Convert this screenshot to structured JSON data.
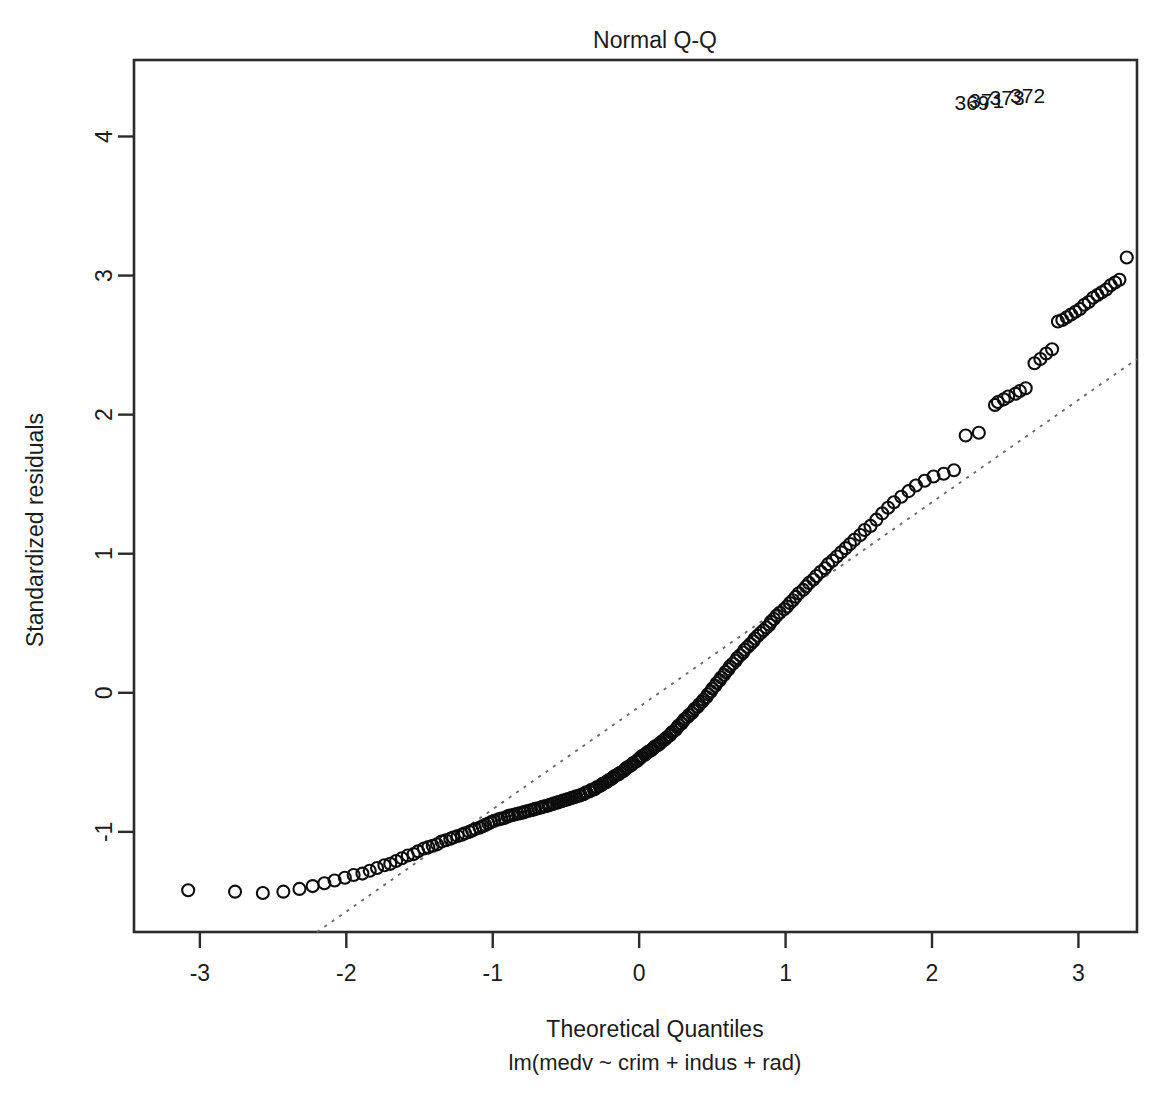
{
  "chart_data": {
    "type": "scatter",
    "title": "Normal Q-Q",
    "xlabel": "Theoretical Quantiles",
    "sublabel": "lm(medv ~ crim + indus + rad)",
    "ylabel": "Standardized residuals",
    "xlim": [
      -3.45,
      3.4
    ],
    "ylim": [
      -1.72,
      4.55
    ],
    "xticks": [
      -3,
      -2,
      -1,
      0,
      1,
      2,
      3
    ],
    "xtick_labels": [
      "-3",
      "-2",
      "-1",
      "0",
      "1",
      "2",
      "3"
    ],
    "yticks": [
      -1,
      0,
      1,
      2,
      3,
      4
    ],
    "ytick_labels": [
      "-1",
      "0",
      "1",
      "2",
      "3",
      "4"
    ],
    "grid": false,
    "legend": "none",
    "reference_line": {
      "style": "dotted",
      "x0": -2.2,
      "y0": -1.72,
      "x1": 3.4,
      "y1": 2.4,
      "color": "#6b6b6b"
    },
    "point_style": {
      "marker": "open-circle",
      "radius": 6.0,
      "color": "#0d0d0d"
    },
    "outlier_labels": [
      {
        "label": "369",
        "x": 2.42,
        "y": 4.13
      },
      {
        "label": "371",
        "x": 2.52,
        "y": 4.15
      },
      {
        "label": "373",
        "x": 2.66,
        "y": 4.17
      },
      {
        "label": "372",
        "x": 2.8,
        "y": 4.18
      }
    ],
    "points": [
      [
        -3.08,
        -1.42
      ],
      [
        -2.76,
        -1.43
      ],
      [
        -2.57,
        -1.44
      ],
      [
        -2.43,
        -1.43
      ],
      [
        -2.32,
        -1.41
      ],
      [
        -2.23,
        -1.39
      ],
      [
        -2.15,
        -1.37
      ],
      [
        -2.08,
        -1.35
      ],
      [
        -2.01,
        -1.33
      ],
      [
        -1.95,
        -1.31
      ],
      [
        -1.89,
        -1.3
      ],
      [
        -1.84,
        -1.28
      ],
      [
        -1.79,
        -1.26
      ],
      [
        -1.74,
        -1.24
      ],
      [
        -1.7,
        -1.23
      ],
      [
        -1.66,
        -1.21
      ],
      [
        -1.62,
        -1.19
      ],
      [
        -1.58,
        -1.17
      ],
      [
        -1.54,
        -1.16
      ],
      [
        -1.51,
        -1.14
      ],
      [
        -1.47,
        -1.12
      ],
      [
        -1.44,
        -1.11
      ],
      [
        -1.41,
        -1.1
      ],
      [
        -1.38,
        -1.09
      ],
      [
        -1.35,
        -1.07
      ],
      [
        -1.32,
        -1.06
      ],
      [
        -1.29,
        -1.05
      ],
      [
        -1.27,
        -1.04
      ],
      [
        -1.24,
        -1.03
      ],
      [
        -1.21,
        -1.02
      ],
      [
        -1.19,
        -1.01
      ],
      [
        -1.16,
        -1.0
      ],
      [
        -1.14,
        -0.99
      ],
      [
        -1.12,
        -0.98
      ],
      [
        -1.09,
        -0.97
      ],
      [
        -1.07,
        -0.96
      ],
      [
        -1.05,
        -0.95
      ],
      [
        -1.03,
        -0.94
      ],
      [
        -1.01,
        -0.93
      ],
      [
        -0.99,
        -0.92
      ],
      [
        -0.96,
        -0.91
      ],
      [
        -0.94,
        -0.905
      ],
      [
        -0.92,
        -0.9
      ],
      [
        -0.9,
        -0.89
      ],
      [
        -0.89,
        -0.885
      ],
      [
        -0.87,
        -0.88
      ],
      [
        -0.85,
        -0.875
      ],
      [
        -0.83,
        -0.87
      ],
      [
        -0.81,
        -0.865
      ],
      [
        -0.79,
        -0.86
      ],
      [
        -0.78,
        -0.855
      ],
      [
        -0.76,
        -0.85
      ],
      [
        -0.74,
        -0.845
      ],
      [
        -0.72,
        -0.84
      ],
      [
        -0.71,
        -0.835
      ],
      [
        -0.69,
        -0.83
      ],
      [
        -0.67,
        -0.825
      ],
      [
        -0.66,
        -0.82
      ],
      [
        -0.64,
        -0.815
      ],
      [
        -0.62,
        -0.81
      ],
      [
        -0.61,
        -0.805
      ],
      [
        -0.59,
        -0.8
      ],
      [
        -0.58,
        -0.795
      ],
      [
        -0.56,
        -0.79
      ],
      [
        -0.55,
        -0.785
      ],
      [
        -0.53,
        -0.78
      ],
      [
        -0.52,
        -0.775
      ],
      [
        -0.5,
        -0.77
      ],
      [
        -0.49,
        -0.765
      ],
      [
        -0.47,
        -0.76
      ],
      [
        -0.46,
        -0.755
      ],
      [
        -0.44,
        -0.75
      ],
      [
        -0.43,
        -0.745
      ],
      [
        -0.41,
        -0.74
      ],
      [
        -0.4,
        -0.735
      ],
      [
        -0.38,
        -0.73
      ],
      [
        -0.37,
        -0.72
      ],
      [
        -0.36,
        -0.715
      ],
      [
        -0.34,
        -0.71
      ],
      [
        -0.33,
        -0.7
      ],
      [
        -0.31,
        -0.695
      ],
      [
        -0.3,
        -0.69
      ],
      [
        -0.29,
        -0.68
      ],
      [
        -0.27,
        -0.67
      ],
      [
        -0.26,
        -0.665
      ],
      [
        -0.25,
        -0.655
      ],
      [
        -0.23,
        -0.645
      ],
      [
        -0.22,
        -0.64
      ],
      [
        -0.21,
        -0.63
      ],
      [
        -0.19,
        -0.62
      ],
      [
        -0.18,
        -0.61
      ],
      [
        -0.17,
        -0.6
      ],
      [
        -0.15,
        -0.59
      ],
      [
        -0.14,
        -0.585
      ],
      [
        -0.13,
        -0.575
      ],
      [
        -0.11,
        -0.565
      ],
      [
        -0.1,
        -0.555
      ],
      [
        -0.09,
        -0.545
      ],
      [
        -0.08,
        -0.535
      ],
      [
        -0.06,
        -0.525
      ],
      [
        -0.05,
        -0.515
      ],
      [
        -0.04,
        -0.505
      ],
      [
        -0.02,
        -0.495
      ],
      [
        -0.01,
        -0.485
      ],
      [
        0.0,
        -0.475
      ],
      [
        0.01,
        -0.465
      ],
      [
        0.02,
        -0.455
      ],
      [
        0.04,
        -0.445
      ],
      [
        0.05,
        -0.435
      ],
      [
        0.06,
        -0.425
      ],
      [
        0.08,
        -0.415
      ],
      [
        0.09,
        -0.405
      ],
      [
        0.1,
        -0.395
      ],
      [
        0.11,
        -0.385
      ],
      [
        0.13,
        -0.375
      ],
      [
        0.14,
        -0.365
      ],
      [
        0.15,
        -0.355
      ],
      [
        0.17,
        -0.34
      ],
      [
        0.18,
        -0.33
      ],
      [
        0.19,
        -0.32
      ],
      [
        0.21,
        -0.305
      ],
      [
        0.22,
        -0.29
      ],
      [
        0.23,
        -0.28
      ],
      [
        0.25,
        -0.265
      ],
      [
        0.26,
        -0.25
      ],
      [
        0.27,
        -0.235
      ],
      [
        0.29,
        -0.22
      ],
      [
        0.3,
        -0.205
      ],
      [
        0.31,
        -0.19
      ],
      [
        0.33,
        -0.175
      ],
      [
        0.34,
        -0.16
      ],
      [
        0.36,
        -0.145
      ],
      [
        0.37,
        -0.13
      ],
      [
        0.38,
        -0.115
      ],
      [
        0.4,
        -0.1
      ],
      [
        0.41,
        -0.085
      ],
      [
        0.43,
        -0.065
      ],
      [
        0.44,
        -0.05
      ],
      [
        0.46,
        -0.03
      ],
      [
        0.47,
        -0.01
      ],
      [
        0.49,
        0.01
      ],
      [
        0.5,
        0.03
      ],
      [
        0.52,
        0.05
      ],
      [
        0.53,
        0.07
      ],
      [
        0.55,
        0.09
      ],
      [
        0.56,
        0.11
      ],
      [
        0.58,
        0.13
      ],
      [
        0.59,
        0.15
      ],
      [
        0.61,
        0.17
      ],
      [
        0.62,
        0.19
      ],
      [
        0.64,
        0.21
      ],
      [
        0.66,
        0.23
      ],
      [
        0.67,
        0.25
      ],
      [
        0.69,
        0.27
      ],
      [
        0.71,
        0.29
      ],
      [
        0.72,
        0.31
      ],
      [
        0.74,
        0.33
      ],
      [
        0.76,
        0.35
      ],
      [
        0.78,
        0.37
      ],
      [
        0.79,
        0.39
      ],
      [
        0.81,
        0.41
      ],
      [
        0.83,
        0.43
      ],
      [
        0.85,
        0.45
      ],
      [
        0.87,
        0.47
      ],
      [
        0.89,
        0.49
      ],
      [
        0.9,
        0.51
      ],
      [
        0.92,
        0.53
      ],
      [
        0.94,
        0.555
      ],
      [
        0.96,
        0.575
      ],
      [
        0.99,
        0.6
      ],
      [
        1.01,
        0.62
      ],
      [
        1.03,
        0.645
      ],
      [
        1.05,
        0.665
      ],
      [
        1.07,
        0.69
      ],
      [
        1.09,
        0.715
      ],
      [
        1.12,
        0.74
      ],
      [
        1.14,
        0.765
      ],
      [
        1.16,
        0.79
      ],
      [
        1.19,
        0.815
      ],
      [
        1.21,
        0.84
      ],
      [
        1.24,
        0.87
      ],
      [
        1.27,
        0.895
      ],
      [
        1.29,
        0.925
      ],
      [
        1.32,
        0.95
      ],
      [
        1.35,
        0.98
      ],
      [
        1.38,
        1.01
      ],
      [
        1.41,
        1.04
      ],
      [
        1.44,
        1.07
      ],
      [
        1.47,
        1.1
      ],
      [
        1.51,
        1.135
      ],
      [
        1.54,
        1.17
      ],
      [
        1.58,
        1.2
      ],
      [
        1.62,
        1.245
      ],
      [
        1.66,
        1.29
      ],
      [
        1.7,
        1.33
      ],
      [
        1.74,
        1.37
      ],
      [
        1.79,
        1.41
      ],
      [
        1.84,
        1.45
      ],
      [
        1.89,
        1.49
      ],
      [
        1.95,
        1.525
      ],
      [
        2.01,
        1.555
      ],
      [
        2.08,
        1.575
      ],
      [
        2.15,
        1.6
      ],
      [
        2.23,
        1.85
      ],
      [
        2.32,
        1.87
      ],
      [
        2.43,
        2.07
      ],
      [
        2.45,
        2.09
      ],
      [
        2.49,
        2.11
      ],
      [
        2.52,
        2.13
      ],
      [
        2.57,
        2.15
      ],
      [
        2.6,
        2.17
      ],
      [
        2.64,
        2.19
      ],
      [
        2.7,
        2.37
      ],
      [
        2.74,
        2.4
      ],
      [
        2.78,
        2.44
      ],
      [
        2.82,
        2.47
      ],
      [
        2.86,
        2.67
      ],
      [
        2.89,
        2.68
      ],
      [
        2.92,
        2.7
      ],
      [
        2.95,
        2.72
      ],
      [
        2.98,
        2.74
      ],
      [
        3.01,
        2.76
      ],
      [
        3.04,
        2.79
      ],
      [
        3.07,
        2.81
      ],
      [
        3.1,
        2.84
      ],
      [
        3.13,
        2.86
      ],
      [
        3.16,
        2.88
      ],
      [
        3.19,
        2.9
      ],
      [
        3.22,
        2.93
      ],
      [
        3.25,
        2.95
      ],
      [
        3.28,
        2.97
      ],
      [
        3.33,
        3.13
      ]
    ]
  }
}
